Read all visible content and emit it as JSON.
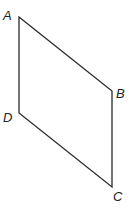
{
  "diagram": {
    "type": "parallelogram",
    "stroke_color": "#2a2a2a",
    "vertices": [
      {
        "label": "A",
        "x": 19,
        "y": 17,
        "label_x": 3,
        "label_y": 20
      },
      {
        "label": "B",
        "x": 112,
        "y": 91,
        "label_x": 116,
        "label_y": 98
      },
      {
        "label": "C",
        "x": 112,
        "y": 187,
        "label_x": 113,
        "label_y": 201
      },
      {
        "label": "D",
        "x": 19,
        "y": 113,
        "label_x": 3,
        "label_y": 122
      }
    ],
    "edges": [
      {
        "from": "A",
        "to": "B"
      },
      {
        "from": "B",
        "to": "C"
      },
      {
        "from": "C",
        "to": "D"
      },
      {
        "from": "D",
        "to": "A"
      }
    ]
  }
}
